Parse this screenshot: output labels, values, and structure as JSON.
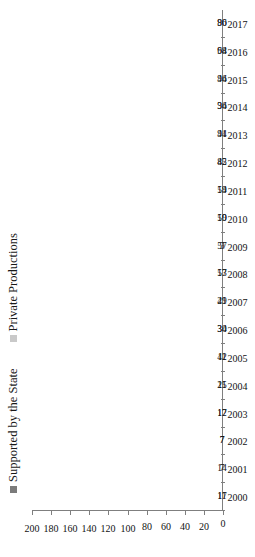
{
  "chart_data": {
    "type": "bar",
    "subtype": "stacked-horizontal",
    "title": "",
    "xlabel": "",
    "ylabel": "",
    "ylim": [
      0,
      200
    ],
    "ytick_step": 20,
    "yticks": [
      "0",
      "20",
      "40",
      "60",
      "80",
      "100",
      "120",
      "140",
      "160",
      "180",
      "200"
    ],
    "grid": false,
    "legend_position": "top-left",
    "categories": [
      "2000",
      "2001",
      "2002",
      "2003",
      "2004",
      "2005",
      "2006",
      "2007",
      "2008",
      "2009",
      "2010",
      "2011",
      "2012",
      "2013",
      "2014",
      "2015",
      "2016",
      "2017"
    ],
    "series": [
      {
        "name": "Supported by the State",
        "color": "#7b7b7b",
        "values": [
          17,
          7,
          7,
          17,
          25,
          42,
          34,
          41,
          57,
          57,
          59,
          59,
          85,
          94,
          94,
          94,
          94,
          96
        ]
      },
      {
        "name": "Private Productions",
        "color": "#c9c9c9",
        "values": [
          11,
          14,
          7,
          12,
          11,
          11,
          30,
          29,
          13,
          9,
          10,
          14,
          42,
          41,
          36,
          46,
          68,
          80
        ]
      }
    ]
  },
  "legend": {
    "items": [
      {
        "label": "Supported by the State",
        "color": "#7b7b7b"
      },
      {
        "label": "Private Productions",
        "color": "#c9c9c9"
      }
    ]
  },
  "axis": {
    "value_ticks": [
      "0",
      "20",
      "40",
      "60",
      "80",
      "100",
      "120",
      "140",
      "160",
      "180",
      "200"
    ],
    "category_ticks": [
      "2000",
      "2001",
      "2002",
      "2003",
      "2004",
      "2005",
      "2006",
      "2007",
      "2008",
      "2009",
      "2010",
      "2011",
      "2012",
      "2013",
      "2014",
      "2015",
      "2016",
      "2017"
    ]
  },
  "colors": {
    "state": "#7b7b7b",
    "private": "#c9c9c9",
    "axis": "#7f7f7f",
    "text": "#111111",
    "background": "#ffffff"
  }
}
